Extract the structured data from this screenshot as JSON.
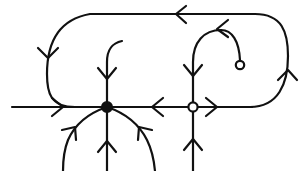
{
  "figure": {
    "type": "phase-portrait",
    "background_color": "#ffffff",
    "stroke_color": "#111111",
    "canvas": {
      "width": 306,
      "height": 171
    }
  },
  "equilibria": [
    {
      "id": "stable-node",
      "marker": "filled-circle",
      "label": "",
      "x": 107,
      "y": 107,
      "radius": 5.2,
      "fill": "#111111",
      "stroke": "#111111"
    },
    {
      "id": "saddle-point",
      "marker": "open-circle",
      "label": "",
      "x": 193,
      "y": 107,
      "radius": 4.6,
      "fill": "#ffffff",
      "stroke": "#111111"
    },
    {
      "id": "spiral-terminus",
      "marker": "open-circle-small",
      "label": "",
      "x": 240,
      "y": 65,
      "radius": 4.2,
      "fill": "#ffffff",
      "stroke": "#111111"
    }
  ],
  "orbit": {
    "id": "closed-periodic-orbit",
    "shape": "stadium",
    "left": 75,
    "right": 270,
    "top": 14,
    "bottom": 107,
    "corner_radius": 46,
    "direction": "counter-clockwise",
    "stroke_width": 2.2
  },
  "trajectories": [
    {
      "id": "horizontal-axis-left",
      "direction": "rightward",
      "stroke_width": 2.2
    },
    {
      "id": "horizontal-axis-middle",
      "direction": "leftward",
      "stroke_width": 2.2
    },
    {
      "id": "horizontal-axis-right",
      "direction": "rightward",
      "stroke_width": 2.2
    },
    {
      "id": "vertical-into-stable-node-top",
      "direction": "downward",
      "stroke_width": 2.2
    },
    {
      "id": "vertical-into-stable-node-bottom",
      "direction": "upward",
      "stroke_width": 2.2
    },
    {
      "id": "curve-lower-left-into-node",
      "direction": "up-right",
      "stroke_width": 2.2
    },
    {
      "id": "curve-lower-right-into-node",
      "direction": "up-left",
      "stroke_width": 2.2
    },
    {
      "id": "vertical-into-saddle-top",
      "direction": "downward",
      "stroke_width": 2.2
    },
    {
      "id": "vertical-into-saddle-bottom",
      "direction": "upward",
      "stroke_width": 2.2
    },
    {
      "id": "spiral-arc-to-terminus",
      "direction": "leftward-arc",
      "stroke_width": 2.2
    }
  ],
  "arrowheads": [
    {
      "id": "arrow-orbit-top",
      "x": 178,
      "y": 14,
      "rotation": 180
    },
    {
      "id": "arrow-orbit-left",
      "x": 75,
      "y": 56,
      "rotation": 90
    },
    {
      "id": "arrow-orbit-right",
      "x": 270,
      "y": 70,
      "rotation": 270
    },
    {
      "id": "arrow-axis-left",
      "x": 60,
      "y": 107,
      "rotation": 0
    },
    {
      "id": "arrow-axis-middle",
      "x": 155,
      "y": 107,
      "rotation": 180
    },
    {
      "id": "arrow-axis-right",
      "x": 212,
      "y": 107,
      "rotation": 0
    },
    {
      "id": "arrow-node-top",
      "x": 107,
      "y": 78,
      "rotation": 90
    },
    {
      "id": "arrow-node-bottom",
      "x": 107,
      "y": 148,
      "rotation": 270
    },
    {
      "id": "arrow-node-lower-left",
      "x": 73,
      "y": 131,
      "rotation": 300
    },
    {
      "id": "arrow-node-lower-right",
      "x": 142,
      "y": 131,
      "rotation": 240
    },
    {
      "id": "arrow-saddle-top",
      "x": 193,
      "y": 75,
      "rotation": 90
    },
    {
      "id": "arrow-saddle-bottom",
      "x": 193,
      "y": 146,
      "rotation": 270
    },
    {
      "id": "arrow-spiral",
      "x": 224,
      "y": 40,
      "rotation": 200
    }
  ]
}
